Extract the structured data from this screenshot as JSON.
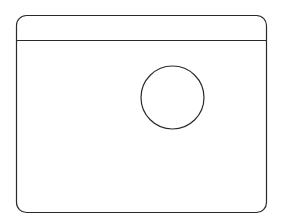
{
  "canvas": {
    "width": 284,
    "height": 224,
    "background": "#ffffff"
  },
  "stroke_color": "#2a2a2a",
  "window_frame": {
    "x": 16.5,
    "y": 15.5,
    "width": 250,
    "height": 197,
    "corner_radius": 10
  },
  "header_divider": {
    "y": 40.5
  },
  "circle": {
    "cx": 172.5,
    "cy": 97.5,
    "r": 31.5
  }
}
